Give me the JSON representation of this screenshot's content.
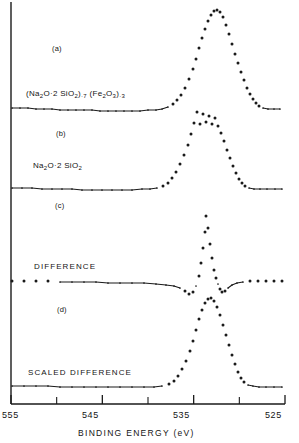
{
  "figure": {
    "domain": "chart",
    "background": "#ffffff",
    "ink_color": "#1a1a1a"
  },
  "axis": {
    "title": "BINDING  ENERGY  (eV)",
    "tick_labels": [
      "555",
      "545",
      "535",
      "525"
    ],
    "tick_values": [
      555,
      545,
      535,
      525
    ],
    "minor_tick_values": [
      550,
      540,
      530
    ],
    "range": [
      555,
      525
    ],
    "reversed": true
  },
  "panels": [
    {
      "tag": "(a)",
      "label": "(Na2O·2SiO2)·7 (Fe2O3)·3",
      "label_html": "(Na<sub>2</sub>O·2 SiO<sub>2</sub>)<sub>·7</sub> (Fe<sub>2</sub>O<sub>3</sub>)<sub>·3</sub>",
      "tag_pos": {
        "x": 52,
        "y": 48
      },
      "label_pos": {
        "x": 26,
        "y": 94
      }
    },
    {
      "tag": "(b)",
      "label": "Na2O·2SiO2",
      "label_html": "Na<sub>2</sub>O·2 SiO<sub>2</sub>",
      "tag_pos": {
        "x": 56,
        "y": 133
      },
      "label_pos": {
        "x": 33,
        "y": 166
      }
    },
    {
      "tag": "(c)",
      "label": "DIFFERENCE",
      "label_html": "DIFFERENCE",
      "tag_pos": {
        "x": 55,
        "y": 205
      },
      "label_pos": {
        "x": 34,
        "y": 266
      }
    },
    {
      "tag": "(d)",
      "label": "SCALED DIFFERENCE",
      "label_html": "SCALED  DIFFERENCE",
      "tag_pos": {
        "x": 57,
        "y": 309
      },
      "label_pos": {
        "x": 28,
        "y": 372
      }
    }
  ],
  "chart_data": {
    "type": "scatter",
    "title": "",
    "xlabel": "BINDING  ENERGY  (eV)",
    "ylabel": "",
    "xlim": [
      555,
      525
    ],
    "ylim": [
      0,
      1
    ],
    "grid": false,
    "legend": "none",
    "marker": "dot",
    "series": [
      {
        "name": "(a) (Na2O·2SiO2)·7 (Fe2O3)·3",
        "peak_center_ev": 532.9,
        "baseline_px": 110,
        "points_px": [
          [
            12,
            108
          ],
          [
            20,
            108
          ],
          [
            28,
            108
          ],
          [
            36,
            109
          ],
          [
            44,
            109
          ],
          [
            52,
            109
          ],
          [
            60,
            110
          ],
          [
            68,
            110
          ],
          [
            76,
            110
          ],
          [
            84,
            110
          ],
          [
            92,
            110
          ],
          [
            100,
            111
          ],
          [
            108,
            111
          ],
          [
            116,
            111
          ],
          [
            124,
            111
          ],
          [
            132,
            111
          ],
          [
            140,
            111
          ],
          [
            148,
            110
          ],
          [
            156,
            110
          ],
          [
            162,
            109
          ],
          [
            168,
            107
          ],
          [
            173,
            104
          ],
          [
            177,
            100
          ],
          [
            181,
            95
          ],
          [
            185,
            88
          ],
          [
            189,
            79
          ],
          [
            193,
            69
          ],
          [
            196,
            59
          ],
          [
            199,
            48
          ],
          [
            202,
            38
          ],
          [
            205,
            29
          ],
          [
            208,
            21
          ],
          [
            211,
            15
          ],
          [
            214,
            11
          ],
          [
            217,
            10
          ],
          [
            220,
            12
          ],
          [
            223,
            17
          ],
          [
            226,
            25
          ],
          [
            229,
            34
          ],
          [
            232,
            44
          ],
          [
            235,
            54
          ],
          [
            238,
            63
          ],
          [
            241,
            72
          ],
          [
            244,
            80
          ],
          [
            247,
            88
          ],
          [
            250,
            94
          ],
          [
            253,
            99
          ],
          [
            256,
            103
          ],
          [
            259,
            106
          ],
          [
            263,
            108
          ],
          [
            268,
            109
          ],
          [
            274,
            109
          ],
          [
            280,
            109
          ]
        ]
      },
      {
        "name": "(b) Na2O·2SiO2",
        "peak_center_ev": 532.6,
        "baseline_px": 190,
        "points_px": [
          [
            12,
            188
          ],
          [
            22,
            188
          ],
          [
            32,
            188
          ],
          [
            42,
            189
          ],
          [
            52,
            189
          ],
          [
            62,
            189
          ],
          [
            72,
            189
          ],
          [
            82,
            190
          ],
          [
            92,
            190
          ],
          [
            102,
            190
          ],
          [
            112,
            190
          ],
          [
            122,
            190
          ],
          [
            132,
            190
          ],
          [
            142,
            189
          ],
          [
            150,
            189
          ],
          [
            157,
            188
          ],
          [
            163,
            186
          ],
          [
            168,
            183
          ],
          [
            172,
            178
          ],
          [
            176,
            172
          ],
          [
            180,
            164
          ],
          [
            184,
            155
          ],
          [
            188,
            145
          ],
          [
            191,
            134
          ],
          [
            194,
            123
          ],
          [
            197,
            112
          ],
          [
            200,
            124
          ],
          [
            203,
            114
          ],
          [
            206,
            122
          ],
          [
            209,
            116
          ],
          [
            212,
            124
          ],
          [
            215,
            118
          ],
          [
            218,
            126
          ],
          [
            221,
            133
          ],
          [
            224,
            141
          ],
          [
            227,
            150
          ],
          [
            230,
            158
          ],
          [
            233,
            166
          ],
          [
            236,
            173
          ],
          [
            239,
            179
          ],
          [
            242,
            183
          ],
          [
            245,
            186
          ],
          [
            249,
            188
          ],
          [
            254,
            189
          ],
          [
            260,
            189
          ],
          [
            267,
            189
          ],
          [
            275,
            189
          ],
          [
            282,
            189
          ]
        ]
      },
      {
        "name": "(c) DIFFERENCE",
        "peak_center_ev": 532.8,
        "baseline_px": 285,
        "points_px": [
          [
            12,
            281
          ],
          [
            24,
            281
          ],
          [
            36,
            281
          ],
          [
            48,
            281
          ],
          [
            60,
            282
          ],
          [
            72,
            282
          ],
          [
            84,
            282
          ],
          [
            96,
            282
          ],
          [
            108,
            283
          ],
          [
            120,
            283
          ],
          [
            132,
            283
          ],
          [
            144,
            283
          ],
          [
            156,
            284
          ],
          [
            166,
            285
          ],
          [
            174,
            286
          ],
          [
            180,
            288
          ],
          [
            185,
            291
          ],
          [
            189,
            294
          ],
          [
            193,
            292
          ],
          [
            196,
            286
          ],
          [
            199,
            276
          ],
          [
            201,
            263
          ],
          [
            203,
            248
          ],
          [
            205,
            232
          ],
          [
            206,
            216
          ],
          [
            208,
            228
          ],
          [
            210,
            244
          ],
          [
            212,
            258
          ],
          [
            214,
            270
          ],
          [
            216,
            278
          ],
          [
            218,
            284
          ],
          [
            220,
            289
          ],
          [
            222,
            292
          ],
          [
            225,
            291
          ],
          [
            228,
            288
          ],
          [
            232,
            285
          ],
          [
            237,
            283
          ],
          [
            243,
            282
          ],
          [
            250,
            281
          ],
          [
            258,
            281
          ],
          [
            266,
            281
          ],
          [
            274,
            281
          ],
          [
            282,
            281
          ]
        ]
      },
      {
        "name": "(d) SCALED DIFFERENCE",
        "peak_center_ev": 532.7,
        "baseline_px": 388,
        "points_px": [
          [
            12,
            386
          ],
          [
            24,
            386
          ],
          [
            36,
            386
          ],
          [
            48,
            386
          ],
          [
            60,
            387
          ],
          [
            72,
            387
          ],
          [
            84,
            387
          ],
          [
            96,
            387
          ],
          [
            108,
            387
          ],
          [
            120,
            387
          ],
          [
            132,
            387
          ],
          [
            144,
            387
          ],
          [
            154,
            387
          ],
          [
            162,
            386
          ],
          [
            169,
            384
          ],
          [
            174,
            381
          ],
          [
            178,
            376
          ],
          [
            182,
            369
          ],
          [
            186,
            361
          ],
          [
            190,
            351
          ],
          [
            193,
            341
          ],
          [
            196,
            330
          ],
          [
            199,
            319
          ],
          [
            202,
            310
          ],
          [
            205,
            303
          ],
          [
            208,
            299
          ],
          [
            211,
            298
          ],
          [
            214,
            301
          ],
          [
            217,
            307
          ],
          [
            220,
            315
          ],
          [
            223,
            325
          ],
          [
            226,
            335
          ],
          [
            229,
            345
          ],
          [
            232,
            355
          ],
          [
            235,
            364
          ],
          [
            238,
            372
          ],
          [
            241,
            378
          ],
          [
            244,
            382
          ],
          [
            248,
            385
          ],
          [
            253,
            386
          ],
          [
            259,
            387
          ],
          [
            266,
            387
          ],
          [
            274,
            387
          ],
          [
            282,
            387
          ]
        ]
      }
    ]
  }
}
